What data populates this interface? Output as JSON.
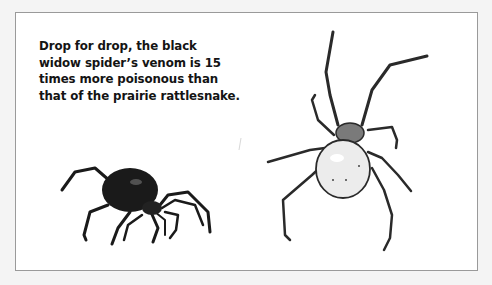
{
  "caption": {
    "lines": [
      "Drop for drop, the black",
      "widow spider’s venom is 15",
      "times more poisonous than",
      "that of the prairie rattlesnake."
    ]
  },
  "illustrations": [
    {
      "name": "black-widow-female",
      "description": "black spider with glossy abdomen"
    },
    {
      "name": "black-widow-male-or-juvenile",
      "description": "pale spider with light abdomen and banded legs"
    }
  ],
  "colors": {
    "background": "#f4f4f4",
    "panel": "#ffffff",
    "border": "#9a9a9a",
    "text": "#141414",
    "spider_dark": "#1a1a1a",
    "spider_pale": "#ececec"
  }
}
